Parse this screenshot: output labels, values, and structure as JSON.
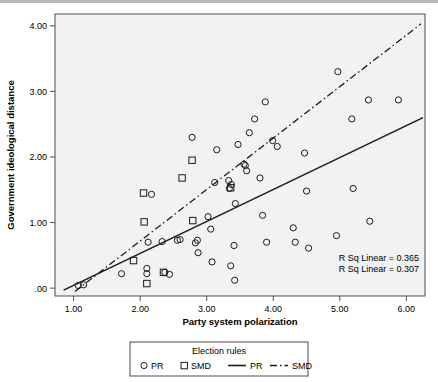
{
  "chart_data": {
    "type": "scatter",
    "title": "",
    "xlabel": "Party system polarization",
    "ylabel": "Government ideological distance",
    "xlim": [
      0.72,
      6.28
    ],
    "ylim": [
      -0.12,
      4.18
    ],
    "xticks": [
      "1.00",
      "2.00",
      "3.00",
      "4.00",
      "5.00",
      "6.00"
    ],
    "xtick_values": [
      1,
      2,
      3,
      4,
      5,
      6
    ],
    "yticks": [
      ".00",
      "1.00",
      "2.00",
      "3.00",
      "4.00"
    ],
    "ytick_values": [
      0,
      1,
      2,
      3,
      4
    ],
    "grid": false,
    "legend_position": "bottom",
    "annotations": [
      "R Sq Linear = 0.365",
      "R Sq Linear = 0.307"
    ],
    "series": [
      {
        "name": "PR",
        "marker": "circle",
        "points": [
          [
            1.07,
            0.04
          ],
          [
            1.15,
            0.05
          ],
          [
            1.72,
            0.22
          ],
          [
            2.1,
            0.3
          ],
          [
            2.1,
            0.22
          ],
          [
            2.37,
            0.24
          ],
          [
            2.44,
            0.21
          ],
          [
            2.17,
            1.43
          ],
          [
            2.12,
            0.7
          ],
          [
            2.33,
            0.71
          ],
          [
            2.56,
            0.73
          ],
          [
            2.6,
            0.74
          ],
          [
            2.78,
            2.3
          ],
          [
            2.83,
            0.69
          ],
          [
            2.86,
            0.73
          ],
          [
            2.87,
            0.54
          ],
          [
            3.02,
            1.09
          ],
          [
            3.06,
            0.9
          ],
          [
            3.08,
            0.4
          ],
          [
            3.12,
            1.61
          ],
          [
            3.15,
            2.11
          ],
          [
            3.33,
            1.64
          ],
          [
            3.34,
            1.52
          ],
          [
            3.36,
            0.34
          ],
          [
            3.37,
            1.58
          ],
          [
            3.41,
            0.65
          ],
          [
            3.42,
            0.12
          ],
          [
            3.47,
            2.19
          ],
          [
            3.56,
            1.89
          ],
          [
            3.58,
            1.87
          ],
          [
            3.6,
            1.79
          ],
          [
            3.64,
            2.37
          ],
          [
            3.72,
            2.58
          ],
          [
            3.8,
            1.68
          ],
          [
            3.84,
            1.11
          ],
          [
            3.88,
            2.84
          ],
          [
            3.9,
            0.7
          ],
          [
            3.99,
            2.25
          ],
          [
            4.06,
            2.16
          ],
          [
            4.3,
            0.92
          ],
          [
            4.33,
            0.7
          ],
          [
            4.47,
            2.06
          ],
          [
            4.5,
            1.48
          ],
          [
            4.53,
            0.61
          ],
          [
            3.43,
            1.29
          ],
          [
            4.97,
            3.3
          ],
          [
            4.95,
            0.8
          ],
          [
            5.18,
            2.58
          ],
          [
            5.2,
            1.52
          ],
          [
            5.43,
            2.87
          ],
          [
            5.45,
            1.02
          ],
          [
            5.88,
            2.87
          ]
        ]
      },
      {
        "name": "SMD",
        "marker": "square",
        "points": [
          [
            1.9,
            0.42
          ],
          [
            2.05,
            1.45
          ],
          [
            2.06,
            1.01
          ],
          [
            2.1,
            0.07
          ],
          [
            2.35,
            0.24
          ],
          [
            2.63,
            1.68
          ],
          [
            2.78,
            1.95
          ],
          [
            2.79,
            1.03
          ],
          [
            3.36,
            1.53
          ]
        ]
      }
    ],
    "fit_lines": [
      {
        "name": "PR",
        "style": "solid",
        "x0": 0.85,
        "y0": -0.03,
        "x1": 6.25,
        "y1": 2.6
      },
      {
        "name": "SMD",
        "style": "dash-dot",
        "x0": 1.02,
        "y0": -0.05,
        "x1": 6.22,
        "y1": 4.03
      }
    ]
  },
  "legend": {
    "title": "Election rules",
    "entries": [
      {
        "label": "PR",
        "kind": "circle"
      },
      {
        "label": "SMD",
        "kind": "square"
      },
      {
        "label": "PR",
        "kind": "solid-line"
      },
      {
        "label": "SMD",
        "kind": "dashdot-line"
      }
    ]
  },
  "colors": {
    "plot_background": "#f2f2f2",
    "axis": "#4d4d4d",
    "mark": "#1a1a1a",
    "text": "#000000",
    "top_bar": "#b9b9b9"
  }
}
